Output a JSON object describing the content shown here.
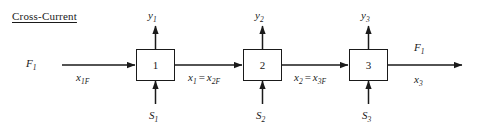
{
  "diagram": {
    "title": "Cross-Current",
    "type": "process-flow-diagram",
    "stages": [
      {
        "box_label": "1",
        "top_label_base": "y",
        "top_label_sub": "1",
        "bottom_label_base": "S",
        "bottom_label_sub": "1"
      },
      {
        "box_label": "2",
        "top_label_base": "y",
        "top_label_sub": "2",
        "bottom_label_base": "S",
        "bottom_label_sub": "2"
      },
      {
        "box_label": "3",
        "top_label_base": "y",
        "top_label_sub": "3",
        "bottom_label_base": "S",
        "bottom_label_sub": "3"
      }
    ],
    "inlet": {
      "flow_base": "F",
      "flow_sub": "1",
      "composition_base": "x",
      "composition_sub": "1F"
    },
    "interstage": [
      {
        "left_base": "x",
        "left_sub": "1",
        "operator": "=",
        "right_base": "x",
        "right_sub": "2F"
      },
      {
        "left_base": "x",
        "left_sub": "2",
        "operator": "=",
        "right_base": "x",
        "right_sub": "3F"
      }
    ],
    "outlet": {
      "flow_base": "F",
      "flow_sub": "1",
      "composition_base": "x",
      "composition_sub": "3"
    }
  }
}
